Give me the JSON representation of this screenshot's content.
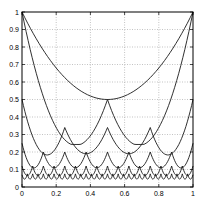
{
  "chart_data": {
    "type": "line",
    "title": "",
    "xlabel": "",
    "ylabel": "",
    "xlim": [
      0,
      1
    ],
    "ylim": [
      0,
      1
    ],
    "grid": true,
    "legend": null,
    "x_ticks": [
      "0",
      "0.2",
      "0.4",
      "0.6",
      "0.8",
      "1"
    ],
    "y_ticks": [
      "0",
      "0.1",
      "0.2",
      "0.3",
      "0.4",
      "0.5",
      "0.6",
      "0.7",
      "0.8",
      "0.9",
      "1"
    ],
    "series": [
      {
        "name": "level 1",
        "description": "single parabola over [0,1]",
        "key_points": [
          [
            0,
            1
          ],
          [
            0.5,
            0.5
          ],
          [
            1,
            1
          ]
        ]
      },
      {
        "name": "level 2",
        "description": "two arcs, cusp at 0.5",
        "key_points": [
          [
            0,
            1
          ],
          [
            0.25,
            0.27
          ],
          [
            0.5,
            0.5
          ],
          [
            0.75,
            0.27
          ],
          [
            1,
            1
          ]
        ]
      },
      {
        "name": "level 3",
        "description": "four arcs",
        "key_points": [
          [
            0,
            0.5
          ],
          [
            0.125,
            0.2
          ],
          [
            0.25,
            0.34
          ],
          [
            0.375,
            0.2
          ],
          [
            0.5,
            0.5
          ],
          [
            0.625,
            0.2
          ],
          [
            0.75,
            0.34
          ],
          [
            0.875,
            0.2
          ],
          [
            1,
            0.5
          ]
        ]
      },
      {
        "name": "level 4",
        "description": "eight arcs",
        "key_points": [
          [
            0,
            0.25
          ],
          [
            0.0625,
            0.12
          ],
          [
            0.125,
            0.2
          ],
          [
            0.25,
            0.2
          ],
          [
            0.5,
            0.2
          ],
          [
            1,
            0.25
          ]
        ]
      },
      {
        "name": "level 5",
        "description": "sixteen arcs",
        "key_points": [
          [
            0,
            0.12
          ],
          [
            0.03,
            0.07
          ],
          [
            0.0625,
            0.12
          ],
          [
            1,
            0.12
          ]
        ]
      },
      {
        "name": "level 6",
        "description": "thirty-two arcs",
        "key_points": [
          [
            0,
            0.06
          ],
          [
            0.015,
            0.04
          ],
          [
            0.03,
            0.07
          ],
          [
            1,
            0.06
          ]
        ]
      }
    ],
    "curve_levels": [
      {
        "level": 1,
        "arcs": 1,
        "edge": 1.0,
        "mid": 0.5,
        "low": 0.5
      },
      {
        "level": 2,
        "arcs": 2,
        "edge": 1.0,
        "mid": 0.5,
        "low": 0.27
      },
      {
        "level": 3,
        "arcs": 4,
        "edge": 0.5,
        "mid": 0.34,
        "low": 0.19
      },
      {
        "level": 4,
        "arcs": 8,
        "edge": 0.25,
        "mid": 0.2,
        "low": 0.11
      },
      {
        "level": 5,
        "arcs": 16,
        "edge": 0.12,
        "mid": 0.12,
        "low": 0.065
      },
      {
        "level": 6,
        "arcs": 32,
        "edge": 0.07,
        "mid": 0.075,
        "low": 0.045
      }
    ]
  },
  "colors": {
    "line": "#1a1a1a",
    "grid": "#9a9a9a",
    "axis": "#000000",
    "background": "#ffffff"
  }
}
